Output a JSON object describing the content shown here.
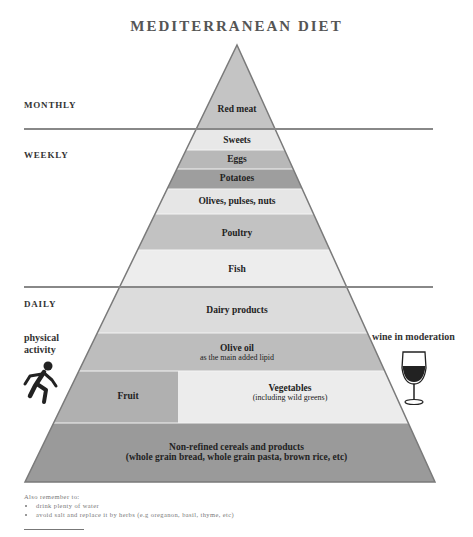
{
  "title": "MEDITERRANEAN DIET",
  "frequencies": {
    "monthly": "MONTHLY",
    "weekly": "WEEKLY",
    "daily": "DAILY"
  },
  "tiers": [
    {
      "label": "Red meat",
      "frequency": "monthly",
      "color": "#c4c4c4"
    },
    {
      "label": "Sweets",
      "frequency": "weekly",
      "color": "#e8e8e8"
    },
    {
      "label": "Eggs",
      "frequency": "weekly",
      "color": "#b8b8b8"
    },
    {
      "label": "Potatoes",
      "frequency": "weekly",
      "color": "#9e9e9e"
    },
    {
      "label": "Olives, pulses, nuts",
      "frequency": "weekly",
      "color": "#e6e6e6"
    },
    {
      "label": "Poultry",
      "frequency": "weekly",
      "color": "#c2c2c2"
    },
    {
      "label": "Fish",
      "frequency": "weekly",
      "color": "#ededed"
    },
    {
      "label": "Dairy products",
      "frequency": "daily",
      "color": "#dcdcdc"
    },
    {
      "label": "Olive oil",
      "sublabel": "as the main added lipid",
      "frequency": "daily",
      "color": "#bdbdbd"
    },
    {
      "label": "Fruit",
      "frequency": "daily",
      "color": "#b0b0b0"
    },
    {
      "label": "Vegetables",
      "sublabel": "(including wild greens)",
      "frequency": "daily",
      "color": "#ececec"
    },
    {
      "label": "Non-refined cereals and products",
      "sublabel": "(whole grain bread, whole grain pasta, brown rice, etc)",
      "frequency": "daily",
      "color": "#9a9a9a"
    }
  ],
  "side_notes": {
    "physical_activity": "physical activity",
    "wine": "wine in moderation"
  },
  "icons": {
    "physical_activity": "running-person-icon",
    "wine": "wine-glass-icon"
  },
  "footer": {
    "heading": "Also remember to:",
    "items": [
      "drink plenty of water",
      "avoid salt and replace it by herbs (e.g oreganon, basil, thyme, etc)"
    ]
  }
}
